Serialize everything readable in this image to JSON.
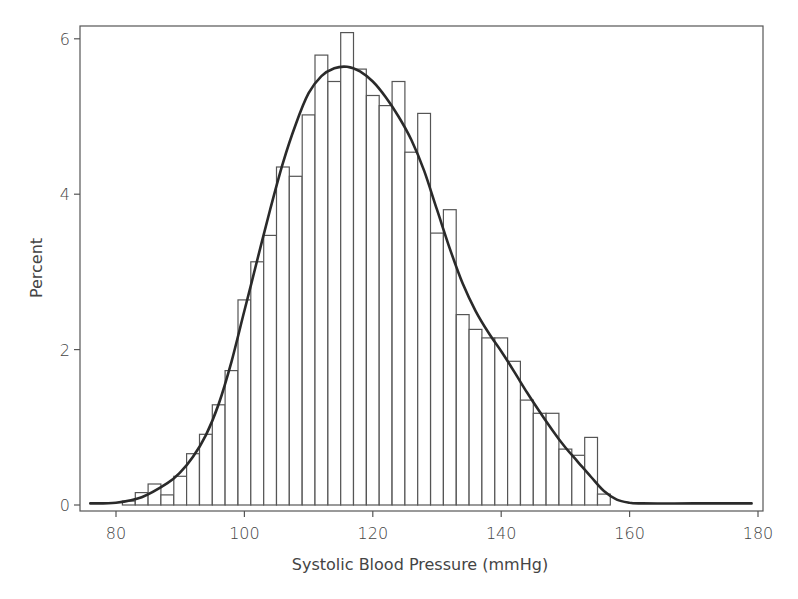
{
  "chart_data": {
    "type": "bar",
    "subtype": "histogram_with_density_curve",
    "title": "",
    "xlabel": "Systolic Blood Pressure (mmHg)",
    "ylabel": "Percent",
    "xlim": [
      75,
      181
    ],
    "ylim": [
      0,
      6.25
    ],
    "x_ticks": [
      80,
      100,
      120,
      140,
      160,
      180
    ],
    "y_ticks": [
      0,
      2,
      4,
      6
    ],
    "bin_width": 2,
    "grid": false,
    "legend": null,
    "bins": [
      {
        "center": 82,
        "value": 0.05
      },
      {
        "center": 84,
        "value": 0.16
      },
      {
        "center": 86,
        "value": 0.27
      },
      {
        "center": 88,
        "value": 0.13
      },
      {
        "center": 90,
        "value": 0.37
      },
      {
        "center": 92,
        "value": 0.66
      },
      {
        "center": 94,
        "value": 0.91
      },
      {
        "center": 96,
        "value": 1.29
      },
      {
        "center": 98,
        "value": 1.73
      },
      {
        "center": 100,
        "value": 2.64
      },
      {
        "center": 102,
        "value": 3.13
      },
      {
        "center": 104,
        "value": 3.47
      },
      {
        "center": 106,
        "value": 4.35
      },
      {
        "center": 108,
        "value": 4.23
      },
      {
        "center": 110,
        "value": 5.02
      },
      {
        "center": 112,
        "value": 5.79
      },
      {
        "center": 114,
        "value": 5.45
      },
      {
        "center": 116,
        "value": 6.08
      },
      {
        "center": 118,
        "value": 5.61
      },
      {
        "center": 120,
        "value": 5.27
      },
      {
        "center": 122,
        "value": 5.14
      },
      {
        "center": 124,
        "value": 5.45
      },
      {
        "center": 126,
        "value": 4.54
      },
      {
        "center": 128,
        "value": 5.04
      },
      {
        "center": 130,
        "value": 3.5
      },
      {
        "center": 132,
        "value": 3.8
      },
      {
        "center": 134,
        "value": 2.45
      },
      {
        "center": 136,
        "value": 2.26
      },
      {
        "center": 138,
        "value": 2.15
      },
      {
        "center": 140,
        "value": 2.15
      },
      {
        "center": 142,
        "value": 1.85
      },
      {
        "center": 144,
        "value": 1.35
      },
      {
        "center": 146,
        "value": 1.18
      },
      {
        "center": 148,
        "value": 1.18
      },
      {
        "center": 150,
        "value": 0.72
      },
      {
        "center": 152,
        "value": 0.64
      },
      {
        "center": 154,
        "value": 0.87
      },
      {
        "center": 156,
        "value": 0.14
      }
    ],
    "density_curve": {
      "name": "Kernel density",
      "points": [
        [
          76,
          0.02
        ],
        [
          80,
          0.03
        ],
        [
          84,
          0.1
        ],
        [
          88,
          0.28
        ],
        [
          90,
          0.42
        ],
        [
          92,
          0.62
        ],
        [
          94,
          0.9
        ],
        [
          96,
          1.3
        ],
        [
          98,
          1.85
        ],
        [
          100,
          2.5
        ],
        [
          102,
          3.15
        ],
        [
          104,
          3.8
        ],
        [
          106,
          4.4
        ],
        [
          108,
          4.9
        ],
        [
          110,
          5.3
        ],
        [
          112,
          5.52
        ],
        [
          114,
          5.62
        ],
        [
          116,
          5.64
        ],
        [
          118,
          5.58
        ],
        [
          120,
          5.45
        ],
        [
          122,
          5.25
        ],
        [
          124,
          5.0
        ],
        [
          126,
          4.7
        ],
        [
          128,
          4.3
        ],
        [
          130,
          3.8
        ],
        [
          132,
          3.3
        ],
        [
          134,
          2.85
        ],
        [
          136,
          2.5
        ],
        [
          138,
          2.22
        ],
        [
          140,
          1.98
        ],
        [
          142,
          1.72
        ],
        [
          144,
          1.45
        ],
        [
          146,
          1.2
        ],
        [
          148,
          0.96
        ],
        [
          150,
          0.74
        ],
        [
          152,
          0.55
        ],
        [
          154,
          0.36
        ],
        [
          156,
          0.18
        ],
        [
          158,
          0.07
        ],
        [
          160,
          0.03
        ],
        [
          162,
          0.02
        ],
        [
          170,
          0.02
        ],
        [
          179,
          0.02
        ]
      ]
    }
  }
}
